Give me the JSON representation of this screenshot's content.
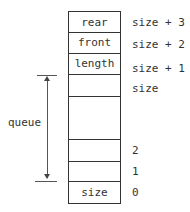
{
  "cells": [
    "rear",
    "front",
    "length",
    "",
    "",
    "",
    "",
    "",
    "size"
  ],
  "indices": [
    "size + 3",
    "size + 2",
    "size + 1",
    "size",
    "",
    "",
    "2",
    "1",
    "0"
  ],
  "bracket_label": "queue"
}
